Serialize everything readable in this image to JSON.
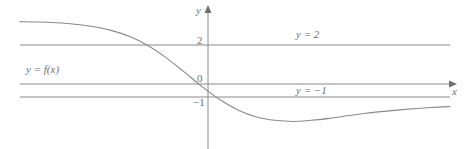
{
  "figure": {
    "background_color": "#ffffff",
    "stroke_color": "#8a8a8a",
    "text_color": "#6f6f6f",
    "width": 467,
    "height": 149
  },
  "axes": {
    "y_axis_label": "y",
    "x_axis_label": "x",
    "y_axis_x_px": 208,
    "x_axis_y_px": 84
  },
  "ticks": {
    "y": [
      {
        "label": "2",
        "value": 2,
        "y_px": 45
      },
      {
        "label": "0",
        "value": 0,
        "y_px": 84
      },
      {
        "label": "−1",
        "value": -1,
        "y_px": 97
      }
    ]
  },
  "labels": {
    "curve": "y = f(x)",
    "asymptote_upper": "y = 2",
    "asymptote_lower": "y = −1"
  },
  "chart_data": {
    "type": "line",
    "title": "",
    "xlabel": "x",
    "ylabel": "y",
    "grid": false,
    "legend": "none",
    "xlim": [
      -4.8,
      4.65
    ],
    "ylim": [
      -2.6,
      2.7
    ],
    "series": [
      {
        "name": "y = f(x)",
        "label": "y = f(x)",
        "color": "#8a8a8a",
        "x": [
          -4.8,
          -4.4,
          -4.0,
          -3.6,
          -3.2,
          -2.8,
          -2.4,
          -2.0,
          -1.6,
          -1.2,
          -0.8,
          -0.4,
          0.0,
          0.4,
          0.8,
          1.2,
          1.6,
          2.0,
          2.4,
          2.8,
          3.2,
          3.6,
          4.0,
          4.4,
          4.65
        ],
        "y": [
          1.93,
          1.92,
          1.89,
          1.84,
          1.76,
          1.62,
          1.41,
          1.09,
          0.66,
          0.15,
          -0.38,
          -0.85,
          -1.22,
          -1.46,
          -1.58,
          -1.62,
          -1.58,
          -1.51,
          -1.42,
          -1.33,
          -1.26,
          -1.2,
          -1.15,
          -1.11,
          -1.09
        ]
      }
    ],
    "annotations": [
      {
        "text": "y = 2",
        "x_px": 300,
        "y_px": 34
      },
      {
        "text": "y = f(x)",
        "x_px": 30,
        "y_px": 69
      },
      {
        "text": "y = −1",
        "x_px": 300,
        "y_px": 90
      }
    ],
    "asymptotes": [
      {
        "kind": "horizontal",
        "label": "y = 2",
        "value": 2,
        "y_px": 45,
        "x_start_px": 20,
        "x_end_px": 450
      },
      {
        "kind": "horizontal",
        "label": "y = −1",
        "value": -1,
        "y_px": 97,
        "x_start_px": 20,
        "x_end_px": 450
      }
    ],
    "notes": {
      "left_limit": 2,
      "right_limit": -1,
      "minimum_approx": {
        "x": 1.2,
        "y": -1.62
      }
    }
  }
}
